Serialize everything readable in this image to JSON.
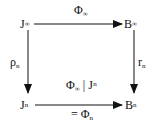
{
  "diagram": {
    "type": "commutative-square",
    "nodes": {
      "top_left": {
        "base": "J",
        "sup": "∞"
      },
      "top_right": {
        "base": "B",
        "sup": "∞"
      },
      "bottom_left": {
        "base": "J",
        "sup": "n"
      },
      "bottom_right": {
        "base": "B",
        "sup": "n"
      }
    },
    "arrows": {
      "top": {
        "from": "J^∞",
        "to": "B^∞",
        "label_base": "Φ",
        "label_sub": "∞"
      },
      "left": {
        "from": "J^∞",
        "to": "J^n",
        "label_base": "ρ",
        "label_sub": "n"
      },
      "right": {
        "from": "B^∞",
        "to": "B^n",
        "label_base": "r",
        "label_sub": "n"
      },
      "bottom": {
        "from": "J^n",
        "to": "B^n",
        "label_above_base": "Φ",
        "label_above_sub": "∞",
        "label_above_rest": " | J",
        "label_above_sup": "n",
        "label_below_prefix": "= Φ",
        "label_below_sub": "n"
      }
    },
    "colors": {
      "stroke": "#111111",
      "background": "#ffffff"
    }
  }
}
